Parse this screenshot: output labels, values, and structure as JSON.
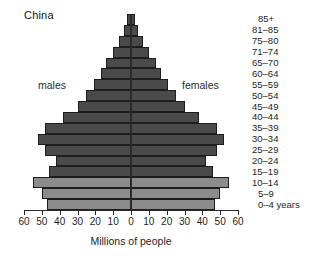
{
  "title": "China",
  "labels": {
    "males": "males",
    "females": "females",
    "x_axis_title": "Millions of people"
  },
  "axis": {
    "tick_labels": [
      "60",
      "50",
      "40",
      "30",
      "20",
      "10",
      "0",
      "10",
      "20",
      "30",
      "40",
      "50",
      "60"
    ],
    "max": 60
  },
  "colors": {
    "bar_dark": "#4a4a4a",
    "bar_light": "#8c8c8c",
    "outline": "#1d1d1d",
    "axis": "#2a2a2a",
    "background": "#ffffff"
  },
  "chart_data": {
    "type": "bar",
    "subtype": "population-pyramid",
    "title": "China",
    "xlabel": "Millions of people",
    "ylabel": "",
    "xlim": [
      -60,
      60
    ],
    "grid": false,
    "legend_position": "inline",
    "categories": [
      "85+",
      "81–85",
      "75–80",
      "71–74",
      "65–70",
      "60–64",
      "55–59",
      "50–54",
      "45–49",
      "40–44",
      "35–39",
      "30–34",
      "25–29",
      "20–24",
      "15–19",
      "10–14",
      "5–9",
      "0–4 years"
    ],
    "series": [
      {
        "name": "males",
        "side": "left",
        "color": "#4a4a4a",
        "values": [
          2,
          4,
          7,
          10,
          14,
          17,
          21,
          25,
          30,
          38,
          48,
          52,
          48,
          42,
          46,
          55,
          50,
          47
        ]
      },
      {
        "name": "females",
        "side": "right",
        "color": "#4a4a4a",
        "values": [
          2,
          4,
          7,
          10,
          14,
          17,
          21,
          25,
          30,
          38,
          48,
          52,
          48,
          42,
          46,
          55,
          50,
          47
        ]
      }
    ],
    "bar_shades": [
      "dark",
      "dark",
      "dark",
      "dark",
      "dark",
      "dark",
      "dark",
      "dark",
      "dark",
      "dark",
      "dark",
      "dark",
      "dark",
      "dark",
      "dark",
      "light",
      "light",
      "light"
    ]
  }
}
